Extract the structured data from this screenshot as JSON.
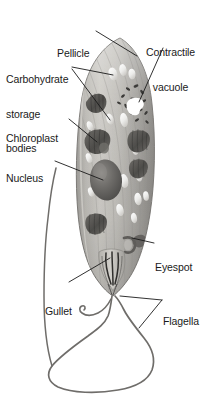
{
  "figure": {
    "organism": "Euglena",
    "style": "grayscale labeled biological diagram",
    "palette": {
      "background": "#ffffff",
      "label_text": "#1a1a1a",
      "leader_line": "#1a1a1a",
      "cell_body_light": "#c9c7c2",
      "cell_body_mid": "#a6a4a0",
      "cell_body_dark": "#807e7a",
      "cell_outline": "#6d6b68",
      "organelle_dark": "#5b5956",
      "organelle_darker": "#3f3e3c",
      "highlight_white": "#f4f3f1",
      "vacuole_white": "#ffffff",
      "flagellum": "#6f6d6a"
    }
  },
  "labels": [
    {
      "id": "pellicle",
      "name": "label-pellicle",
      "lines": [
        "Pellicle"
      ],
      "side": "top",
      "points_to": "outer cell membrane at upper-right of cell"
    },
    {
      "id": "carbohydrate_storage_bodies",
      "name": "label-carbohydrate-storage-bodies",
      "lines": [
        "Carbohydrate",
        "storage",
        "bodies"
      ],
      "side": "left",
      "points_to": "white oval granules in upper cell"
    },
    {
      "id": "chloroplast",
      "name": "label-chloroplast",
      "lines": [
        "Chloroplast"
      ],
      "side": "left",
      "points_to": "dark lens-shaped plastid in mid-left of cell"
    },
    {
      "id": "nucleus",
      "name": "label-nucleus",
      "lines": [
        "Nucleus"
      ],
      "side": "left",
      "points_to": "large dark oval at cell center"
    },
    {
      "id": "contractile_vacuole",
      "name": "label-contractile-vacuole",
      "lines": [
        "Contractile",
        "vacuole"
      ],
      "side": "right",
      "points_to": "bright white blob near anterior of cell"
    },
    {
      "id": "eyespot",
      "name": "label-eyespot",
      "lines": [
        "Eyespot"
      ],
      "side": "right",
      "points_to": "small crescent ring in lower cell"
    },
    {
      "id": "gullet",
      "name": "label-gullet",
      "lines": [
        "Gullet"
      ],
      "side": "left",
      "points_to": "funnel-shaped reservoir at posterior end"
    },
    {
      "id": "flagella",
      "name": "label-flagella",
      "lines": [
        "Flagella"
      ],
      "side": "right",
      "points_to": "two whip-like appendages emerging from gullet"
    }
  ]
}
